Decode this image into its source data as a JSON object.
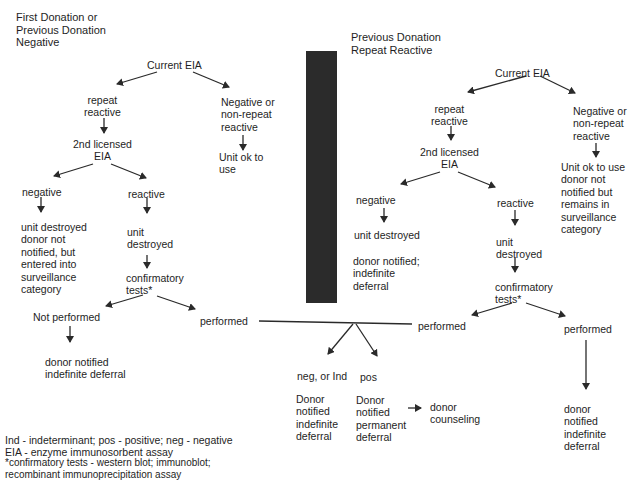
{
  "left_panel": {
    "heading": "First Donation or\nPrevious Donation\nNegative",
    "current_eia": "Current EIA",
    "repeat_reactive": "repeat\nreactive",
    "negative_or_nonrepeat": "Negative or\nnon-repeat\nreactive",
    "unit_ok": "Unit ok to\nuse",
    "second_eia": "2nd licensed\nEIA",
    "negative": "negative",
    "reactive": "reactive",
    "negative_outcome": "unit destroyed\ndonor not\nnotified, but\nentered into\nsurveillance\ncategory",
    "unit_destroyed": "unit\ndestroyed",
    "confirmatory": "confirmatory\ntests*",
    "not_performed": "Not performed",
    "performed": "performed",
    "not_performed_outcome": "donor notified\nindefinite deferral"
  },
  "right_panel": {
    "heading": "Previous Donation\nRepeat Reactive",
    "current_eia": "Current EIA",
    "repeat_reactive": "repeat\nreactive",
    "negative_or_nonrepeat": "Negative or\nnon-repeat\nreactive",
    "unit_ok": "Unit ok to use\ndonor not\nnotified but\nremains in\nsurveillance\ncategory",
    "second_eia": "2nd licensed\nEIA",
    "negative": "negative",
    "reactive": "reactive",
    "negative_unit": "unit destroyed",
    "negative_outcome": "donor notified;\nindefinite\ndeferral",
    "unit_destroyed": "unit\ndestroyed",
    "confirmatory": "confirmatory\ntests*",
    "performed_left": "performed",
    "performed_right": "performed",
    "performed_right_outcome": "donor\nnotified\nindefinite\ndeferral"
  },
  "shared_results": {
    "neg_or_ind": "neg, or Ind",
    "pos": "pos",
    "neg_outcome": "Donor\nnotified\nindefinite\ndeferral",
    "pos_outcome": "Donor\nnotified\npermanent\ndeferral",
    "counseling": "donor\ncounseling"
  },
  "legend": {
    "abbrev_line1": "Ind - indeterminant; pos - positive; neg - negative",
    "abbrev_line2": "EIA - enzyme immunosorbent assay",
    "footnote": "*confirmatory tests - western blot; immunoblot;\nrecombinant immunoprecipitation assay"
  },
  "colors": {
    "text": "#1e1e1e",
    "divider_bar": "#2b2b2b",
    "background": "#ffffff"
  }
}
